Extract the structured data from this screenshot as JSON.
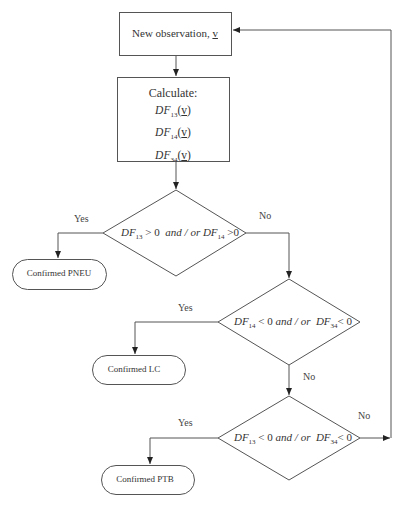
{
  "nodes": {
    "start": {
      "label": "New observation, ",
      "var": "v"
    },
    "calculate": {
      "title": "Calculate:",
      "functions": [
        {
          "name": "DF",
          "sub": "13",
          "arg": "v"
        },
        {
          "name": "DF",
          "sub": "14",
          "arg": "v"
        },
        {
          "name": "DF",
          "sub": "34",
          "arg": "v"
        }
      ]
    },
    "decision1": {
      "a": "DF",
      "a_sub": "13",
      "a_op": " > 0",
      "join": "and / or",
      "b": "DF",
      "b_sub": "14",
      "b_op": " >0"
    },
    "decision2": {
      "a": "DF",
      "a_sub": "14",
      "a_op": " < 0",
      "join": "and / or",
      "b": "DF",
      "b_sub": "34",
      "b_op": "< 0"
    },
    "decision3": {
      "a": "DF",
      "a_sub": "13",
      "a_op": " < 0",
      "join": "and / or",
      "b": "DF",
      "b_sub": "34",
      "b_op": "< 0"
    },
    "outcome1": "Confirmed PNEU",
    "outcome2": "Confirmed LC",
    "outcome3": "Confirmed PTB"
  },
  "edges": {
    "d1_yes": "Yes",
    "d1_no": "No",
    "d2_yes": "Yes",
    "d2_no": "No",
    "d3_yes": "Yes",
    "d3_no": "No"
  },
  "colors": {
    "stroke": "#555555",
    "text": "#333333",
    "background": "#ffffff"
  }
}
